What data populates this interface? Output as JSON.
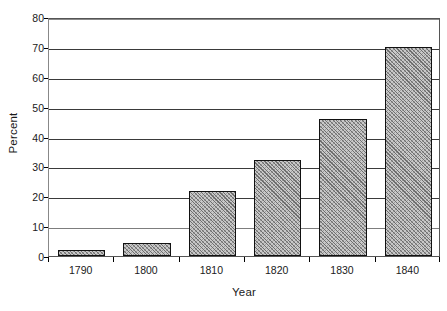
{
  "chart_data": {
    "type": "bar",
    "title": "",
    "subtitle": "",
    "xlabel": "Year",
    "ylabel": "Percent",
    "categories": [
      "1790",
      "1800",
      "1810",
      "1820",
      "1830",
      "1840"
    ],
    "values": [
      2,
      4.3,
      21.7,
      32.1,
      45.8,
      70
    ],
    "series": [
      {
        "name": "Percent",
        "values": [
          2,
          4.3,
          21.7,
          32.1,
          45.8,
          70
        ]
      }
    ],
    "ylim": [
      0,
      80
    ],
    "ytick_labels": [
      "0",
      "10",
      "20",
      "30",
      "40",
      "50",
      "60",
      "70",
      "80"
    ],
    "ytick_values": [
      0,
      10,
      20,
      30,
      40,
      50,
      60,
      70,
      80
    ],
    "grid": "horizontal",
    "legend": "none",
    "bar_fill": "#c9c9c9",
    "bar_hatch_color": "#6e6e6e",
    "bar_outline": "#111111",
    "gridline_color": "#3a3a3a",
    "axis_color": "#555555",
    "background": "#ffffff",
    "annotations": []
  }
}
